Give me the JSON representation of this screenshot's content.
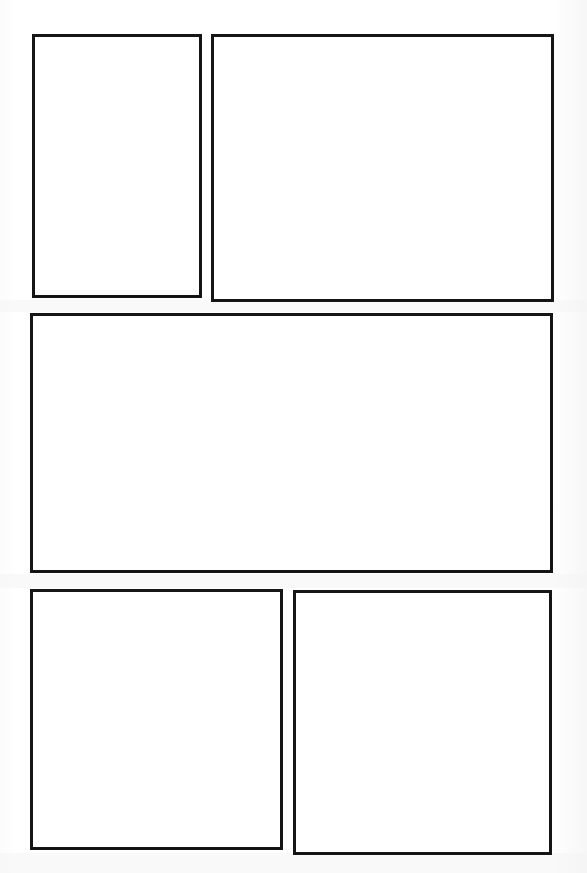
{
  "page": {
    "kind": "comic-page-template",
    "width": 587,
    "height": 873,
    "background_color": "#ffffff",
    "paper_tint_color": "#fcfcfc",
    "ink_color": "#161616",
    "panel_fill_color": "#ffffff",
    "panel_count": 5,
    "row_count": 3,
    "has_text": false,
    "has_artwork": false,
    "has_page_number": false,
    "has_gutter_markings": false
  },
  "layout": {
    "rows": [
      {
        "name": "row-top",
        "panel_names": [
          "panel-1",
          "panel-2"
        ]
      },
      {
        "name": "row-middle",
        "panel_names": [
          "panel-3"
        ]
      },
      {
        "name": "row-bottom",
        "panel_names": [
          "panel-4",
          "panel-5"
        ]
      }
    ],
    "gutter_vertical_px": 9,
    "gutter_horizontal_px": 13,
    "margin_left_px": 30,
    "margin_top_px": 34,
    "margin_right_px": 33,
    "margin_bottom_px": 18
  },
  "panels": [
    {
      "id": "panel-1",
      "name": "panel-top-left",
      "row": "row-top",
      "position": "top-left",
      "shape": "rectangle",
      "content": "",
      "empty": true,
      "x": 32,
      "y": 34,
      "width": 170,
      "height": 264,
      "border_width": 3,
      "border_color": "#161616",
      "fill_color": "#ffffff"
    },
    {
      "id": "panel-2",
      "name": "panel-top-right",
      "row": "row-top",
      "position": "top-right",
      "shape": "rectangle",
      "content": "",
      "empty": true,
      "x": 211,
      "y": 34,
      "width": 343,
      "height": 268,
      "border_width": 3,
      "border_color": "#161616",
      "fill_color": "#ffffff"
    },
    {
      "id": "panel-3",
      "name": "panel-middle-wide",
      "row": "row-middle",
      "position": "middle-full-width",
      "shape": "rectangle",
      "content": "",
      "empty": true,
      "x": 30,
      "y": 313,
      "width": 523,
      "height": 260,
      "border_width": 3,
      "border_color": "#161616",
      "fill_color": "#ffffff"
    },
    {
      "id": "panel-4",
      "name": "panel-bottom-left",
      "row": "row-bottom",
      "position": "bottom-left",
      "shape": "rectangle",
      "content": "",
      "empty": true,
      "x": 30,
      "y": 589,
      "width": 253,
      "height": 261,
      "border_width": 3,
      "border_color": "#161616",
      "fill_color": "#ffffff"
    },
    {
      "id": "panel-5",
      "name": "panel-bottom-right",
      "row": "row-bottom",
      "position": "bottom-right",
      "shape": "rectangle",
      "content": "",
      "empty": true,
      "x": 293,
      "y": 590,
      "width": 259,
      "height": 265,
      "border_width": 3,
      "border_color": "#161616",
      "fill_color": "#ffffff"
    }
  ],
  "scan_bands": [
    {
      "y": 300,
      "height": 12,
      "color": "#f4f4f4"
    },
    {
      "y": 574,
      "height": 14,
      "color": "#f4f4f4"
    },
    {
      "y": 853,
      "height": 20,
      "color": "#f4f4f4"
    }
  ]
}
